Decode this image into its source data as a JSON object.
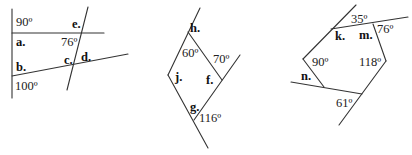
{
  "figures": [
    {
      "id": "figure-1",
      "angles": [
        {
          "text": "90º",
          "x": 16,
          "y": 26
        },
        {
          "text": "76º",
          "x": 61,
          "y": 46
        },
        {
          "text": "100º",
          "x": 15,
          "y": 90
        }
      ],
      "labels": [
        {
          "text": "e.",
          "x": 72,
          "y": 28
        },
        {
          "text": "a.",
          "x": 16,
          "y": 46
        },
        {
          "text": "c.",
          "x": 64,
          "y": 64
        },
        {
          "text": "d.",
          "x": 81,
          "y": 61
        },
        {
          "text": "b.",
          "x": 16,
          "y": 71
        }
      ]
    },
    {
      "id": "figure-2",
      "angles": [
        {
          "text": "60º",
          "x": 182,
          "y": 57
        },
        {
          "text": "70º",
          "x": 213,
          "y": 63
        },
        {
          "text": "116º",
          "x": 199,
          "y": 122
        }
      ],
      "labels": [
        {
          "text": "h.",
          "x": 190,
          "y": 32
        },
        {
          "text": "j.",
          "x": 175,
          "y": 81
        },
        {
          "text": "f.",
          "x": 206,
          "y": 84
        },
        {
          "text": "g.",
          "x": 190,
          "y": 111
        }
      ]
    },
    {
      "id": "figure-3",
      "angles": [
        {
          "text": "35º",
          "x": 351,
          "y": 23
        },
        {
          "text": "76º",
          "x": 377,
          "y": 33
        },
        {
          "text": "90º",
          "x": 312,
          "y": 66
        },
        {
          "text": "118º",
          "x": 359,
          "y": 66
        },
        {
          "text": "61º",
          "x": 336,
          "y": 107
        }
      ],
      "labels": [
        {
          "text": "k.",
          "x": 335,
          "y": 40
        },
        {
          "text": "m.",
          "x": 359,
          "y": 39
        },
        {
          "text": "n.",
          "x": 301,
          "y": 80
        }
      ]
    }
  ],
  "colors": {
    "line": "#333333",
    "text": "#222222",
    "background": "#ffffff"
  }
}
